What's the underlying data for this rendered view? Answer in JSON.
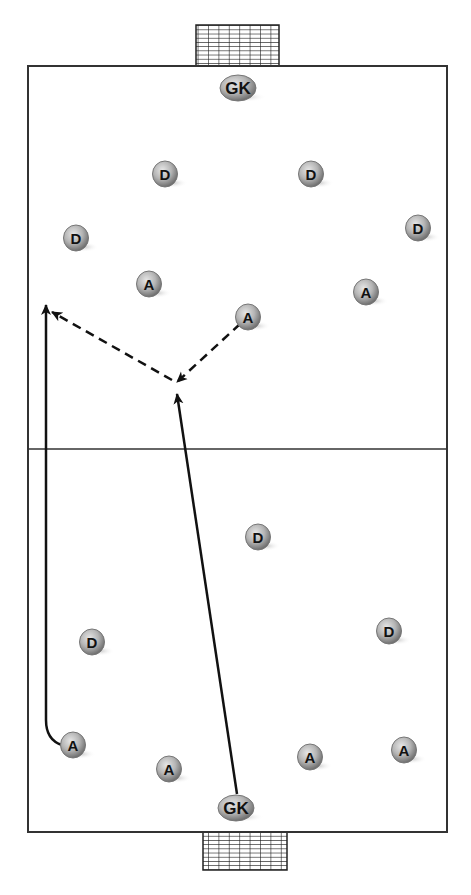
{
  "diagram": {
    "title": "",
    "pitch": {
      "x": 28,
      "y": 66,
      "width": 419,
      "height": 766,
      "halfway_y": 449,
      "line_color": "#333333"
    },
    "goals": [
      {
        "id": "top-goal",
        "x": 196,
        "y": 25,
        "width": 83,
        "height": 41
      },
      {
        "id": "bottom-goal",
        "x": 203,
        "y": 832,
        "width": 84,
        "height": 38
      }
    ],
    "players": [
      {
        "label": "GK",
        "team": "top",
        "x": 238,
        "y": 88
      },
      {
        "label": "D",
        "team": "top",
        "x": 165,
        "y": 174
      },
      {
        "label": "D",
        "team": "top",
        "x": 311,
        "y": 174
      },
      {
        "label": "D",
        "team": "top",
        "x": 76,
        "y": 238
      },
      {
        "label": "D",
        "team": "top",
        "x": 418,
        "y": 228
      },
      {
        "label": "A",
        "team": "top",
        "x": 149,
        "y": 284
      },
      {
        "label": "A",
        "team": "top",
        "x": 366,
        "y": 292
      },
      {
        "label": "A",
        "team": "top",
        "x": 248,
        "y": 317
      },
      {
        "label": "D",
        "team": "bottom",
        "x": 258,
        "y": 537
      },
      {
        "label": "D",
        "team": "bottom",
        "x": 92,
        "y": 642
      },
      {
        "label": "D",
        "team": "bottom",
        "x": 389,
        "y": 631
      },
      {
        "label": "A",
        "team": "bottom",
        "x": 73,
        "y": 745
      },
      {
        "label": "A",
        "team": "bottom",
        "x": 169,
        "y": 769
      },
      {
        "label": "A",
        "team": "bottom",
        "x": 310,
        "y": 757
      },
      {
        "label": "A",
        "team": "bottom",
        "x": 404,
        "y": 750
      },
      {
        "label": "GK",
        "team": "bottom",
        "x": 236,
        "y": 808
      }
    ],
    "runs": [
      {
        "type": "solid",
        "desc": "Left A runs up left touchline",
        "path": "M 62 745 Q 46 740 46 720 L 46 305"
      },
      {
        "type": "solid",
        "desc": "GK long ball to centre",
        "path": "M 237 794 L 177 394"
      }
    ],
    "passes": [
      {
        "type": "dashed",
        "desc": "A lays off to centre point",
        "x1": 240,
        "y1": 324,
        "x2": 177,
        "y2": 382
      },
      {
        "type": "dashed",
        "desc": "Pass to left channel",
        "x1": 172,
        "y1": 380,
        "x2": 52,
        "y2": 312
      }
    ]
  }
}
